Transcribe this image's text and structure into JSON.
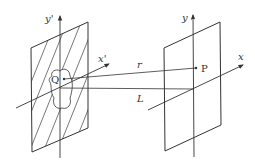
{
  "diagram": {
    "source_plane": {
      "axes": {
        "x_label": "x'",
        "y_label": "y'"
      },
      "aperture_point_label": "Q",
      "hatched": true
    },
    "observation_plane": {
      "axes": {
        "x_label": "x",
        "y_label": "y"
      },
      "point_label": "P"
    },
    "distances": {
      "r_label": "r",
      "L_label": "L"
    },
    "colors": {
      "line": "#333333",
      "background": "#ffffff"
    }
  }
}
